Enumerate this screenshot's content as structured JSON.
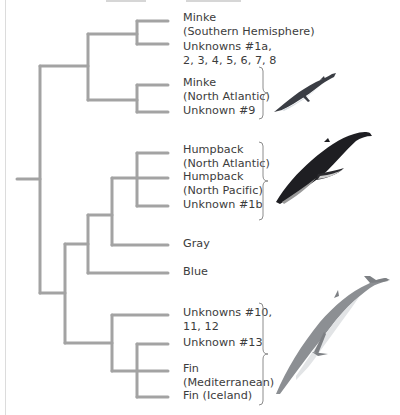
{
  "diagram": {
    "type": "phylogenetic-tree",
    "line_color": "#a3a3a3",
    "text_color": "#3c3c3c",
    "leaves": [
      {
        "id": "minke-sh",
        "label": "Minke\n(Southern Hemisphere)",
        "y": 21
      },
      {
        "id": "unknowns-1a-8",
        "label": "Unknowns #1a,\n2, 3, 4, 5, 6, 7, 8",
        "y": 44
      },
      {
        "id": "minke-na",
        "label": "Minke\n(North Atlantic)",
        "y": 85
      },
      {
        "id": "unknown-9",
        "label": "Unknown #9",
        "y": 112
      },
      {
        "id": "humpback-na",
        "label": "Humpback\n(North Atlantic)",
        "y": 153
      },
      {
        "id": "humpback-np",
        "label": "Humpback\n(North Pacific)",
        "y": 178
      },
      {
        "id": "unknown-1b",
        "label": "Unknown #1b",
        "y": 206
      },
      {
        "id": "gray",
        "label": "Gray",
        "y": 245
      },
      {
        "id": "blue",
        "label": "Blue",
        "y": 273
      },
      {
        "id": "unknowns-10-12",
        "label": "Unknowns #10,\n11, 12",
        "y": 315
      },
      {
        "id": "unknown-13",
        "label": "Unknown #13",
        "y": 344
      },
      {
        "id": "fin-med",
        "label": "Fin\n(Mediterranean)",
        "y": 371
      },
      {
        "id": "fin-iceland",
        "label": "Fin (Iceland)",
        "y": 397
      }
    ],
    "groups": [
      {
        "name": "minke-group",
        "brace_top": 68,
        "brace_bottom": 118,
        "image": "minke-whale-icon"
      },
      {
        "name": "humpback-group",
        "brace_top": 142,
        "brace_bottom": 218,
        "image": "humpback-whale-icon"
      },
      {
        "name": "fin-group",
        "brace_top": 303,
        "brace_bottom": 404,
        "image": "fin-whale-icon"
      }
    ]
  },
  "labels": {
    "minke_sh": "Minke\n(Southern Hemisphere)",
    "unknowns_1a": "Unknowns #1a,\n2, 3, 4, 5, 6, 7, 8",
    "minke_na": "Minke\n(North Atlantic)",
    "unknown_9": "Unknown #9",
    "humpback_na": "Humpback\n(North Atlantic)",
    "humpback_np": "Humpback\n(North Pacific)",
    "unknown_1b": "Unknown #1b",
    "gray": "Gray",
    "blue": "Blue",
    "unknowns_10": "Unknowns #10,\n11, 12",
    "unknown_13": "Unknown #13",
    "fin_med": "Fin\n(Mediterranean)",
    "fin_iceland": "Fin (Iceland)"
  }
}
